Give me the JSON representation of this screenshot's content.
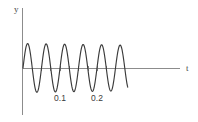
{
  "figure": {
    "title": "",
    "background_color": "#ffffff",
    "axis_color": "#8c8c8c",
    "curve_color": "#3a3a3a"
  },
  "axes": {
    "x_label": "t",
    "y_label": "y",
    "x_label_pos": {
      "x": 186,
      "y": 69
    },
    "y_label_pos": {
      "x": 14,
      "y": 12
    },
    "x_axis_pixel_y": 68,
    "y_axis_pixel_x": 22,
    "x_axis_pixel_start": 22,
    "x_axis_pixel_end": 180,
    "y_axis_pixel_top": 8,
    "y_axis_pixel_bottom": 115
  },
  "ticks": {
    "x_major_labels": [
      "0.1",
      "0.2"
    ],
    "x_major_values": [
      0.1,
      0.2
    ],
    "x_major_pixels": [
      60,
      97
    ],
    "x_minor_pixels": [
      41,
      50,
      60,
      69,
      78,
      88,
      97,
      106
    ],
    "label_y_pixel": 101
  },
  "chart_data": {
    "type": "line",
    "title": "",
    "xlabel": "t",
    "ylabel": "y",
    "xlim": [
      0,
      0.42
    ],
    "ylim": [
      -1.15,
      1.15
    ],
    "grid": false,
    "legend": null,
    "series": [
      {
        "name": "y(t)",
        "function": "sin(2*pi*t/0.05) * decay",
        "period": 0.05,
        "frequency": 20,
        "amplitude_start": 1.0,
        "amplitude_end": 0.93,
        "t_start": 0.0,
        "t_end": 0.283,
        "x": [
          0.0,
          0.0125,
          0.025,
          0.0375,
          0.05,
          0.0625,
          0.075,
          0.0875,
          0.1,
          0.1125,
          0.125,
          0.1375,
          0.15,
          0.1625,
          0.175,
          0.1875,
          0.2,
          0.2125,
          0.225,
          0.2375,
          0.25,
          0.2625,
          0.275,
          0.283
        ],
        "y": [
          0.0,
          1.0,
          0.0,
          -1.0,
          0.0,
          0.99,
          0.0,
          -0.99,
          0.0,
          0.98,
          0.0,
          -0.98,
          0.0,
          0.96,
          0.0,
          -0.96,
          0.0,
          0.95,
          0.0,
          -0.95,
          0.0,
          0.94,
          0.0,
          -0.62
        ]
      }
    ]
  }
}
